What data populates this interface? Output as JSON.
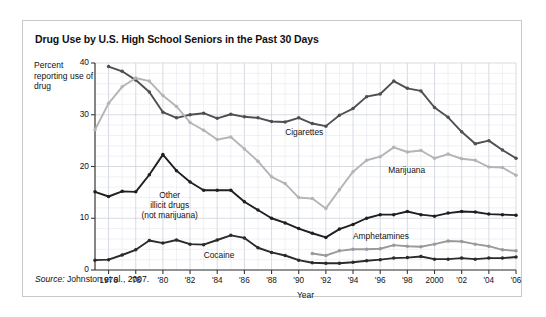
{
  "figure": {
    "title": "Drug Use by U.S. High School Seniors in the Past 30 Days",
    "source_label": "Source:",
    "source_text": " Johnston et al., 2007."
  },
  "axes": {
    "y_axis_title": "Percent reporting use of drug",
    "x_axis_title": "Year",
    "y_ticks": [
      "0",
      "10",
      "20",
      "30",
      "40"
    ],
    "x_ticks": [
      "1976",
      "'78",
      "'80",
      "'82",
      "'84",
      "'86",
      "'88",
      "'90",
      "'92",
      "'94",
      "'96",
      "'98",
      "2000",
      "'02",
      "'04",
      "'06"
    ]
  },
  "labels": {
    "cigarettes": "Cigarettes",
    "marijuana": "Marijuana",
    "amphetamines": "Amphetamines",
    "cocaine": "Cocaine",
    "other_illicit_line1": "Other",
    "other_illicit_line2": "illicit drugs",
    "other_illicit_line3": "(not marijuana)"
  },
  "colors": {
    "cigarettes": "#4f4f4f",
    "marijuana": "#b4b4b4",
    "other_illicit": "#1f1f1f",
    "cocaine": "#2b2b2b",
    "amphetamines": "#9a9a9a",
    "grid_minor": "#dfe3ea",
    "grid_major": "#c6ccd6",
    "axis": "#3a3a3a",
    "frame": "#c9c9c9"
  },
  "chart_data": {
    "type": "line",
    "title": "Drug Use by U.S. High School Seniors in the Past 30 Days",
    "xlabel": "Year",
    "ylabel": "Percent reporting use of drug",
    "xlim": [
      1975,
      2006
    ],
    "ylim": [
      0,
      40
    ],
    "grid": true,
    "legend": "inline-labels",
    "x": [
      1975,
      1976,
      1977,
      1978,
      1979,
      1980,
      1981,
      1982,
      1983,
      1984,
      1985,
      1986,
      1987,
      1988,
      1989,
      1990,
      1991,
      1992,
      1993,
      1994,
      1995,
      1996,
      1997,
      1998,
      1999,
      2000,
      2001,
      2002,
      2003,
      2004,
      2005,
      2006
    ],
    "series": [
      {
        "name": "Cigarettes",
        "color": "#4f4f4f",
        "values": [
          null,
          39.3,
          38.4,
          36.7,
          34.4,
          30.5,
          29.4,
          30.0,
          30.3,
          29.3,
          30.1,
          29.6,
          29.4,
          28.7,
          28.6,
          29.4,
          28.3,
          27.8,
          29.9,
          31.2,
          33.5,
          34.0,
          36.5,
          35.1,
          34.6,
          31.4,
          29.5,
          26.7,
          24.4,
          25.0,
          23.2,
          21.6
        ]
      },
      {
        "name": "Marijuana",
        "color": "#b4b4b4",
        "values": [
          27.1,
          32.2,
          35.4,
          37.1,
          36.5,
          33.7,
          31.6,
          28.5,
          27.0,
          25.2,
          25.7,
          23.4,
          21.0,
          18.0,
          16.7,
          14.0,
          13.8,
          11.9,
          15.5,
          19.0,
          21.2,
          21.9,
          23.7,
          22.8,
          23.1,
          21.6,
          22.4,
          21.5,
          21.2,
          19.9,
          19.8,
          18.3
        ]
      },
      {
        "name": "Other illicit drugs (not marijuana)",
        "color": "#1f1f1f",
        "values": [
          15.1,
          14.2,
          15.2,
          15.1,
          18.4,
          22.3,
          19.2,
          17.0,
          15.4,
          15.4,
          15.4,
          13.2,
          11.6,
          10.0,
          9.1,
          8.0,
          7.1,
          6.3,
          7.9,
          8.8,
          10.0,
          10.7,
          10.7,
          11.3,
          10.7,
          10.4,
          11.0,
          11.3,
          11.2,
          10.8,
          10.7,
          10.6
        ]
      },
      {
        "name": "Cocaine",
        "color": "#2b2b2b",
        "values": [
          1.9,
          2.0,
          2.9,
          3.9,
          5.7,
          5.2,
          5.8,
          5.0,
          4.9,
          5.8,
          6.7,
          6.2,
          4.3,
          3.4,
          2.8,
          1.9,
          1.4,
          1.3,
          1.3,
          1.5,
          1.8,
          2.0,
          2.3,
          2.4,
          2.6,
          2.1,
          2.1,
          2.3,
          2.1,
          2.3,
          2.3,
          2.5
        ]
      },
      {
        "name": "Amphetamines",
        "color": "#9a9a9a",
        "values": [
          null,
          null,
          null,
          null,
          null,
          null,
          null,
          null,
          null,
          null,
          null,
          null,
          null,
          null,
          null,
          null,
          3.2,
          2.8,
          3.7,
          4.0,
          4.0,
          4.1,
          4.8,
          4.6,
          4.5,
          5.0,
          5.6,
          5.5,
          5.0,
          4.6,
          3.9,
          3.7
        ]
      }
    ]
  }
}
